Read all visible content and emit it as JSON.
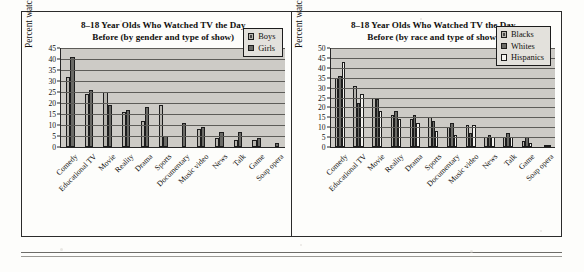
{
  "page": {
    "background": "#fdfdfb",
    "rule_present": true
  },
  "charts": [
    {
      "id": "gender-chart",
      "title": "8–18 Year Olds Who Watched TV the Day Before (by gender and type of show)",
      "title_line1": "8–18 Year Olds Who Watched TV the Day",
      "title_line2": "Before (by gender and type of show)",
      "ylabel": "Percent watching the day before",
      "legend": [
        {
          "label": "Boys",
          "color": "#b6b4ae",
          "style": "hatch"
        },
        {
          "label": "Girls",
          "color": "#6a6a66",
          "style": "solid"
        }
      ]
    },
    {
      "id": "race-chart",
      "title": "8–18 Year Olds Who Watched TV the Day Before (by race and type of show)",
      "title_line1": "8–18 Year Olds Who Watched TV the Day",
      "title_line2": "Before (by race and type of show)",
      "ylabel": "Percent watching the day before",
      "legend": [
        {
          "label": "Blacks",
          "color": "#b6b4ae",
          "style": "hatch"
        },
        {
          "label": "Whites",
          "color": "#6a6a66",
          "style": "solid"
        },
        {
          "label": "Hispanics",
          "color": "#f4f3ef",
          "style": "solid"
        }
      ]
    }
  ],
  "chart_data": [
    {
      "type": "bar",
      "title": "8–18 Year Olds Who Watched TV the Day Before (by gender and type of show)",
      "xlabel": "",
      "ylabel": "Percent watching the day before",
      "ylim": [
        0,
        45
      ],
      "yticks": [
        0,
        5,
        10,
        15,
        20,
        25,
        30,
        35,
        40,
        45
      ],
      "grid": true,
      "legend_position": "top-right",
      "categories": [
        "Comedy",
        "Educational TV",
        "Movie",
        "Reality",
        "Drama",
        "Sports",
        "Documentary",
        "Music video",
        "News",
        "Talk",
        "Game",
        "Soap opera"
      ],
      "series": [
        {
          "name": "Boys",
          "color": "#b6b4ae",
          "values": [
            32,
            24,
            25,
            16,
            12,
            19,
            0,
            8,
            4,
            3,
            3,
            0
          ]
        },
        {
          "name": "Girls",
          "color": "#6a6a66",
          "values": [
            41,
            26,
            19,
            17,
            18,
            5,
            11,
            9,
            7,
            7,
            4,
            2
          ]
        }
      ]
    },
    {
      "type": "bar",
      "title": "8–18 Year Olds Who Watched TV the Day Before (by race and type of show)",
      "xlabel": "",
      "ylabel": "Percent watching the day before",
      "ylim": [
        0,
        50
      ],
      "yticks": [
        0,
        5,
        10,
        15,
        20,
        25,
        30,
        35,
        40,
        45,
        50
      ],
      "grid": true,
      "legend_position": "top-right",
      "categories": [
        "Comedy",
        "Educational TV",
        "Movie",
        "Reality",
        "Drama",
        "Sports",
        "Documentary",
        "Music video",
        "News",
        "Talk",
        "Game",
        "Soap opera"
      ],
      "series": [
        {
          "name": "Blacks",
          "color": "#b6b4ae",
          "values": [
            35,
            31,
            25,
            16,
            14,
            15,
            10,
            11,
            5,
            5,
            3,
            0
          ]
        },
        {
          "name": "Whites",
          "color": "#6a6a66",
          "values": [
            36,
            22,
            24,
            18,
            16,
            13,
            12,
            7,
            6,
            7,
            5,
            1
          ]
        },
        {
          "name": "Hispanics",
          "color": "#f4f3ef",
          "values": [
            43,
            27,
            18,
            14,
            12,
            8,
            6,
            11,
            5,
            5,
            2,
            1
          ]
        }
      ]
    }
  ]
}
